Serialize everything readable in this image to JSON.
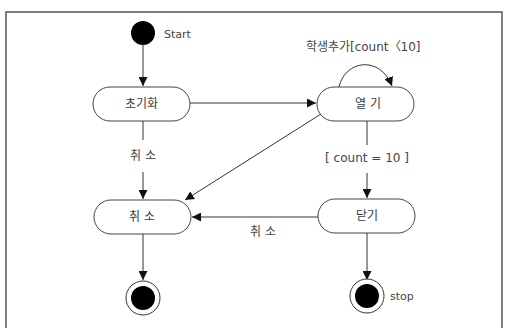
{
  "diagram": {
    "type": "state-machine",
    "colors": {
      "line": "#333333",
      "fill": "#ffffff",
      "node_fill": "#000000",
      "frame": "#555555"
    },
    "initial": {
      "label": "Start"
    },
    "final_left": {
      "label": ""
    },
    "final_right": {
      "label": "stop"
    },
    "states": {
      "init": {
        "label": "초기화"
      },
      "open": {
        "label": "열 기"
      },
      "cancel": {
        "label": "취 소"
      },
      "close": {
        "label": "닫기"
      }
    },
    "transitions": {
      "self_open": {
        "label": "학생추가[count〈10]"
      },
      "init_to_cancel": {
        "label": "취 소"
      },
      "open_to_close": {
        "label": "[ count = 10 ]"
      },
      "close_to_cancel": {
        "label": "취 소"
      }
    }
  }
}
